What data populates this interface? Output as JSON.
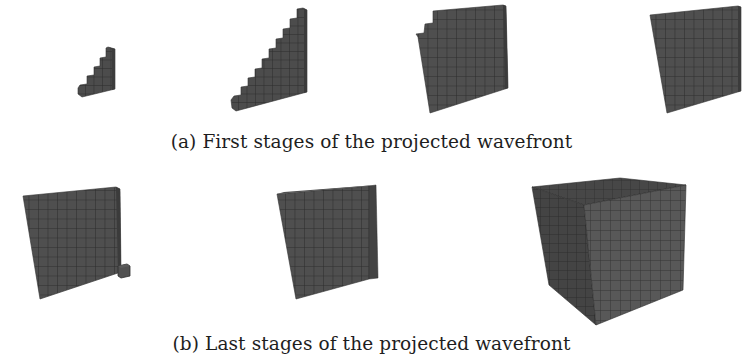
{
  "figure": {
    "subfigures": [
      {
        "id": "a",
        "caption": "(a) First stages of the projected wavefront",
        "panels": [
          {
            "name": "stage-small-staircase",
            "shape": "staircase",
            "steps": 4
          },
          {
            "name": "stage-large-staircase",
            "shape": "staircase",
            "steps": 9
          },
          {
            "name": "stage-notched-plane",
            "shape": "plane-with-steps",
            "steps": 3
          },
          {
            "name": "stage-full-plane",
            "shape": "plane"
          }
        ]
      },
      {
        "id": "b",
        "caption": "(b) Last stages of the projected wavefront",
        "panels": [
          {
            "name": "stage-wall-with-cube",
            "shape": "wall-plus-single-cube"
          },
          {
            "name": "stage-thick-slab",
            "shape": "slab"
          },
          {
            "name": "stage-full-cube",
            "shape": "cube"
          }
        ]
      }
    ],
    "colors": {
      "voxel_fill": "#4d4d4d",
      "voxel_dark": "#3a3a3a",
      "voxel_light": "#5c5c5c",
      "grid_line": "#2a2a2a",
      "background": "#ffffff"
    }
  }
}
